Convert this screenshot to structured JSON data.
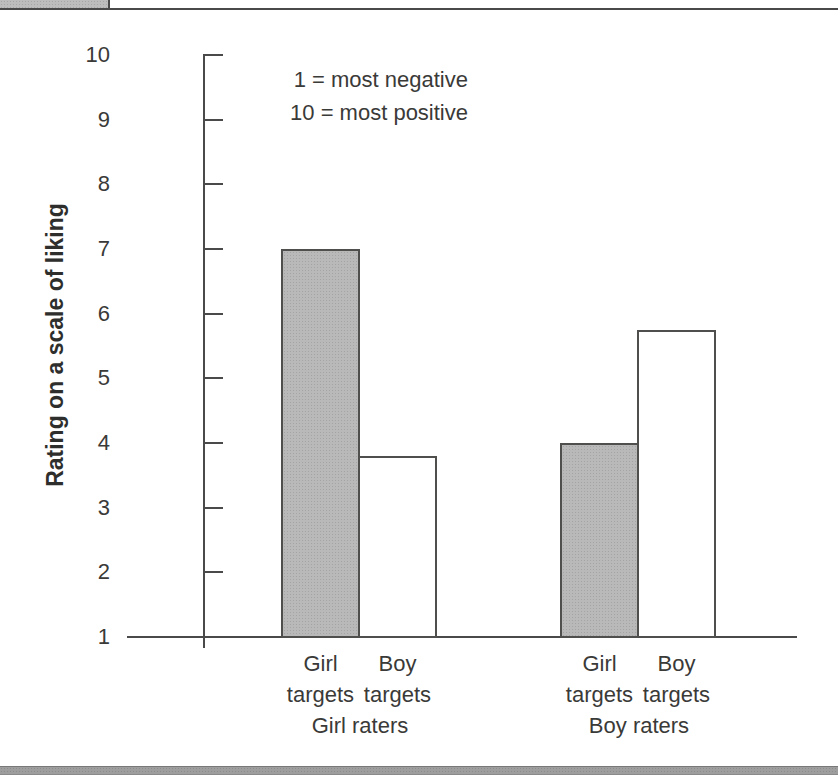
{
  "figure": {
    "ylabel": "Rating on a scale of liking",
    "annotation_lines": [
      "1 = most negative",
      "10 = most positive"
    ]
  },
  "chart_data": {
    "type": "bar",
    "title": "",
    "xlabel": "",
    "ylabel": "Rating on a scale of liking",
    "ylim": [
      1,
      10
    ],
    "yticks": [
      10,
      9,
      8,
      7,
      6,
      5,
      4,
      3,
      2,
      1
    ],
    "annotations": [
      "1 = most negative",
      "10 = most positive"
    ],
    "categories": [
      "Girl raters",
      "Boy raters"
    ],
    "series": [
      {
        "name": "Girl targets",
        "values": [
          7.0,
          4.0
        ],
        "fill": "#b9b9b9"
      },
      {
        "name": "Boy targets",
        "values": [
          3.8,
          5.75
        ],
        "fill": "#ffffff"
      }
    ],
    "grid": false,
    "legend_position": "none",
    "colors": {
      "bar_gray": "#b9b9b9",
      "bar_white": "#ffffff",
      "line": "#4a4a4a"
    }
  }
}
